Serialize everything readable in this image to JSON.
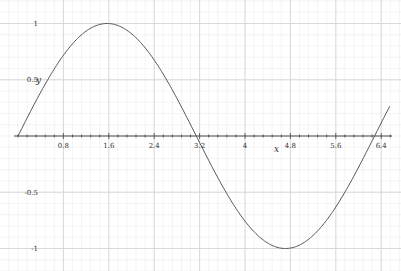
{
  "chart_data": {
    "type": "line",
    "title": "",
    "xlabel": "x",
    "ylabel": "y",
    "x_ticks": [
      "0.8",
      "1.6",
      "2.4",
      "3.2",
      "4",
      "4.8",
      "5.6",
      "6.4"
    ],
    "y_ticks": [
      "1",
      "0.5",
      "-0.5",
      "-1"
    ],
    "xlim": [
      -0.05,
      6.75
    ],
    "ylim": [
      -1.1,
      1.1
    ],
    "grid": true,
    "series": [
      {
        "name": "y = sin(x)",
        "function": "sin(x)",
        "x_range": [
          0,
          6.55
        ],
        "color": "#555555",
        "sample_points": [
          {
            "x": 0,
            "y": 0
          },
          {
            "x": 0.8,
            "y": 0.717
          },
          {
            "x": 1.6,
            "y": 0.9996
          },
          {
            "x": 2.4,
            "y": 0.675
          },
          {
            "x": 3.2,
            "y": -0.058
          },
          {
            "x": 4.0,
            "y": -0.757
          },
          {
            "x": 4.8,
            "y": -0.996
          },
          {
            "x": 5.6,
            "y": -0.631
          },
          {
            "x": 6.4,
            "y": 0.117
          }
        ]
      }
    ]
  },
  "colors": {
    "major_grid": "#d6d6d6",
    "minor_grid": "#ececec",
    "axis": "#444444",
    "curve": "#555555"
  }
}
